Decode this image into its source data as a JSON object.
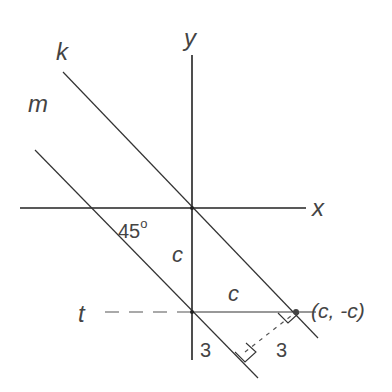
{
  "labels": {
    "x_axis": "x",
    "y_axis": "y",
    "line_k": "k",
    "line_m": "m",
    "line_t": "t",
    "angle": "45",
    "angle_degree": "o",
    "segment_c_vertical": "c",
    "segment_c_horizontal": "c",
    "point": "(c, -c)",
    "distance_left": "3",
    "distance_right": "3"
  },
  "colors": {
    "line": "#333333",
    "text": "#444444"
  }
}
